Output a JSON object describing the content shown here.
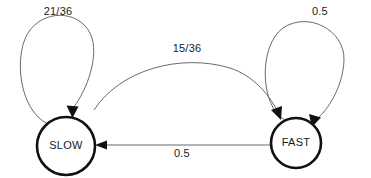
{
  "diagram": {
    "type": "state-transition-diagram",
    "title": "",
    "background_color": "#ffffff",
    "node_stroke_color": "#111111",
    "edge_stroke_color": "#5a5a5a",
    "label_color": "#1a1a1a",
    "nodes": [
      {
        "id": "slow",
        "label": "SLOW",
        "cx": 66,
        "cy": 146,
        "r": 29
      },
      {
        "id": "fast",
        "label": "FAST",
        "cx": 296,
        "cy": 143,
        "r": 25
      }
    ],
    "edges": [
      {
        "id": "slow-self",
        "from": "slow",
        "to": "slow",
        "label": "21/36",
        "label_x": 58,
        "label_y": 12,
        "kind": "self-loop"
      },
      {
        "id": "slow-to-fast",
        "from": "slow",
        "to": "fast",
        "label": "15/36",
        "label_x": 187,
        "label_y": 49,
        "kind": "arc"
      },
      {
        "id": "fast-self",
        "from": "fast",
        "to": "fast",
        "label": "0.5",
        "label_x": 320,
        "label_y": 12,
        "kind": "self-loop"
      },
      {
        "id": "fast-to-slow",
        "from": "fast",
        "to": "slow",
        "label": "0.5",
        "label_x": 182,
        "label_y": 154,
        "kind": "straight"
      }
    ]
  }
}
